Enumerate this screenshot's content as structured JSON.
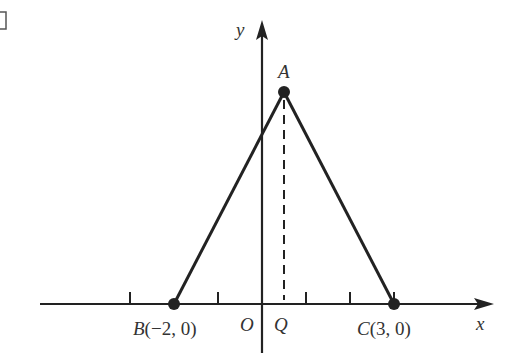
{
  "figure": {
    "corner_mark": "□",
    "axes": {
      "x_label": "x",
      "y_label": "y",
      "origin_label": "O",
      "unit_px": 44,
      "origin_px": [
        262,
        304
      ],
      "ticks": [
        -3,
        -2,
        -1,
        1,
        2,
        3
      ]
    },
    "points": {
      "A": {
        "label": "A",
        "x": 0.5,
        "y": 4.9
      },
      "B": {
        "label": "B(−2, 0)",
        "name": "B",
        "coords": "(−2, 0)",
        "x": -2,
        "y": 0
      },
      "C": {
        "label": "C(3, 0)",
        "name": "C",
        "coords": "(3, 0)",
        "x": 3,
        "y": 0
      },
      "Q": {
        "label": "Q",
        "x": 0.5,
        "y": 0
      }
    },
    "segments": [
      "AB",
      "AC"
    ],
    "dashed": [
      "AQ"
    ],
    "colors": {
      "stroke": "#222222",
      "text": "#333333"
    }
  }
}
